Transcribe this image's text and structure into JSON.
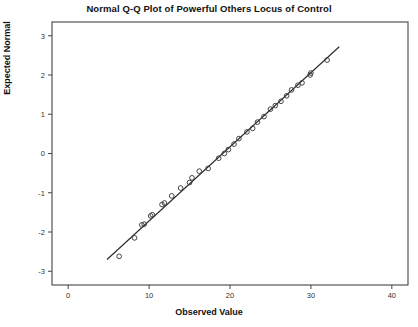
{
  "chart_data": {
    "type": "scatter",
    "title": "Normal Q-Q Plot of Powerful Others Locus of Control",
    "xlabel": "Observed Value",
    "ylabel": "Expected Normal",
    "xlim": [
      -2,
      42
    ],
    "ylim": [
      -3.35,
      3.35
    ],
    "xticks": [
      0,
      10,
      20,
      30,
      40
    ],
    "xtick_labels": [
      "0",
      "10",
      "20",
      "30",
      "40"
    ],
    "yticks": [
      -3,
      -2,
      -1,
      0,
      1,
      2,
      3
    ],
    "ytick_labels": [
      "-3",
      "-2",
      "-1",
      "0",
      "1",
      "2",
      "3"
    ],
    "grid": false,
    "legend": null,
    "series": [
      {
        "name": "Observed quantiles",
        "marker": "open-circle",
        "color": "#3b3b3b",
        "x": [
          6.3,
          8.2,
          9.1,
          9.4,
          10.2,
          10.4,
          11.6,
          11.9,
          12.8,
          13.9,
          15.0,
          15.3,
          16.2,
          17.3,
          18.6,
          19.3,
          19.8,
          20.5,
          21.1,
          22.1,
          22.8,
          23.4,
          24.2,
          25.0,
          25.6,
          26.3,
          27.0,
          27.6,
          28.4,
          28.9,
          29.9,
          30.0,
          32.0
        ],
        "y": [
          -2.62,
          -2.15,
          -1.82,
          -1.8,
          -1.59,
          -1.56,
          -1.3,
          -1.26,
          -1.08,
          -0.88,
          -0.74,
          -0.62,
          -0.45,
          -0.38,
          -0.12,
          0.0,
          0.1,
          0.24,
          0.38,
          0.55,
          0.64,
          0.8,
          0.94,
          1.13,
          1.22,
          1.33,
          1.47,
          1.62,
          1.74,
          1.8,
          2.0,
          2.05,
          2.38
        ]
      }
    ],
    "reference_line": {
      "name": "normal reference line",
      "color": "#2b2b2b",
      "x_start": 4.8,
      "y_start": -2.7,
      "x_end": 33.5,
      "y_end": 2.72
    }
  },
  "axes": {
    "frame_color": "#444444",
    "background": "#ffffff"
  }
}
